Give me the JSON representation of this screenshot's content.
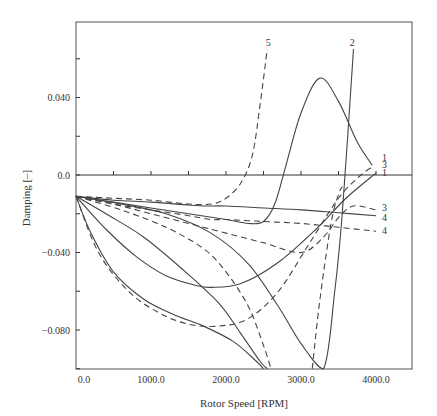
{
  "chart_data": {
    "type": "line",
    "title": "",
    "xlabel": "Rotor Speed [RPM]",
    "ylabel": "Damping [–]",
    "xlim": [
      -100,
      4500
    ],
    "ylim": [
      -0.1,
      0.08
    ],
    "xticks": [
      0,
      1000,
      2000,
      3000,
      4000
    ],
    "xtick_labels": [
      "0.0",
      "1000.0",
      "2000.0",
      "3000.0",
      "4000.0"
    ],
    "yticks": [
      0.04,
      0.0,
      -0.04,
      -0.08
    ],
    "ytick_labels": [
      "0.040",
      "0.0",
      "−0.040",
      "−0.080"
    ],
    "grid": false,
    "series": [
      {
        "name": "1",
        "style": "solid",
        "x": [
          0,
          500,
          1000,
          1500,
          2000,
          2300,
          2500,
          2650,
          2800,
          3000,
          3250,
          3500,
          3750,
          3950
        ],
        "y": [
          -0.011,
          -0.014,
          -0.017,
          -0.02,
          -0.023,
          -0.025,
          -0.024,
          -0.015,
          0.005,
          0.032,
          0.05,
          0.038,
          0.017,
          0.005
        ]
      },
      {
        "name": "1",
        "style": "solid",
        "x": [
          0,
          400,
          800,
          1200,
          1600,
          1800,
          2200,
          2700,
          3200,
          3600,
          4000
        ],
        "y": [
          -0.011,
          -0.028,
          -0.042,
          -0.052,
          -0.057,
          -0.058,
          -0.056,
          -0.045,
          -0.028,
          -0.012,
          0.001
        ]
      },
      {
        "name": "2",
        "style": "solid",
        "x": [
          0,
          600,
          1200,
          1800,
          2300,
          2700,
          3000,
          3300,
          3450,
          3550,
          3700
        ],
        "y": [
          -0.011,
          -0.015,
          -0.02,
          -0.03,
          -0.046,
          -0.068,
          -0.087,
          -0.1,
          -0.06,
          -0.02,
          0.065
        ]
      },
      {
        "name": "3",
        "style": "dashed",
        "x": [
          0,
          500,
          1000,
          1500,
          2000,
          2500,
          3000,
          3300,
          3500,
          3700,
          4000
        ],
        "y": [
          -0.011,
          -0.015,
          -0.02,
          -0.025,
          -0.03,
          -0.035,
          -0.04,
          -0.032,
          -0.022,
          -0.016,
          -0.018
        ]
      },
      {
        "name": "3",
        "style": "dashed",
        "x": [
          0,
          300,
          700,
          1100,
          1500,
          1900,
          2300,
          2700,
          3100,
          3500,
          3800,
          3950
        ],
        "y": [
          -0.011,
          -0.04,
          -0.06,
          -0.071,
          -0.077,
          -0.078,
          -0.074,
          -0.06,
          -0.036,
          -0.012,
          0.0,
          0.004
        ]
      },
      {
        "name": "4",
        "style": "solid",
        "x": [
          0,
          500,
          1000,
          1500,
          1700,
          2000,
          2500,
          3000,
          3500,
          4000
        ],
        "y": [
          -0.011,
          -0.013,
          -0.014,
          -0.0155,
          -0.016,
          -0.016,
          -0.017,
          -0.018,
          -0.0195,
          -0.021
        ]
      },
      {
        "name": "4",
        "style": "dashed",
        "x": [
          0,
          500,
          1000,
          1500,
          1800,
          2000,
          2500,
          3000,
          3500,
          4000
        ],
        "y": [
          -0.011,
          -0.015,
          -0.018,
          -0.021,
          -0.023,
          -0.023,
          -0.024,
          -0.025,
          -0.027,
          -0.029
        ]
      },
      {
        "name": "5",
        "style": "dashed",
        "x": [
          0,
          500,
          1000,
          1500,
          1800,
          2000,
          2200,
          2350,
          2450,
          2550
        ],
        "y": [
          -0.011,
          -0.012,
          -0.013,
          -0.015,
          -0.015,
          -0.012,
          -0.004,
          0.01,
          0.035,
          0.065
        ]
      },
      {
        "name": "",
        "style": "solid",
        "x": [
          0,
          400,
          900,
          1400,
          1900,
          2200,
          2450,
          2550
        ],
        "y": [
          -0.011,
          -0.02,
          -0.032,
          -0.048,
          -0.066,
          -0.082,
          -0.096,
          -0.1
        ]
      },
      {
        "name": "",
        "style": "solid",
        "x": [
          0,
          200,
          500,
          900,
          1300,
          1700,
          2100,
          2400,
          2500
        ],
        "y": [
          -0.011,
          -0.03,
          -0.05,
          -0.064,
          -0.072,
          -0.078,
          -0.086,
          -0.096,
          -0.1
        ]
      },
      {
        "name": "",
        "style": "dashed",
        "x": [
          0,
          600,
          1200,
          1700,
          2000,
          2300,
          2500,
          2600
        ],
        "y": [
          -0.011,
          -0.018,
          -0.027,
          -0.038,
          -0.05,
          -0.068,
          -0.088,
          -0.1
        ]
      },
      {
        "name": "",
        "style": "dashed",
        "x": [
          3150,
          3250,
          3400,
          3500,
          3550
        ],
        "y": [
          -0.1,
          -0.065,
          -0.025,
          -0.01,
          -0.006
        ]
      }
    ],
    "annotations": [
      {
        "text": "5",
        "x": 2530,
        "y": 0.068
      },
      {
        "text": "2",
        "x": 3650,
        "y": 0.068
      },
      {
        "text": "1",
        "x": 4080,
        "y": 0.009
      },
      {
        "text": "3",
        "x": 4080,
        "y": 0.005
      },
      {
        "text": "1",
        "x": 4080,
        "y": 0.001
      },
      {
        "text": "3",
        "x": 4080,
        "y": -0.017
      },
      {
        "text": "4",
        "x": 4080,
        "y": -0.022
      },
      {
        "text": "4",
        "x": 4080,
        "y": -0.029
      }
    ],
    "legend": "none"
  }
}
